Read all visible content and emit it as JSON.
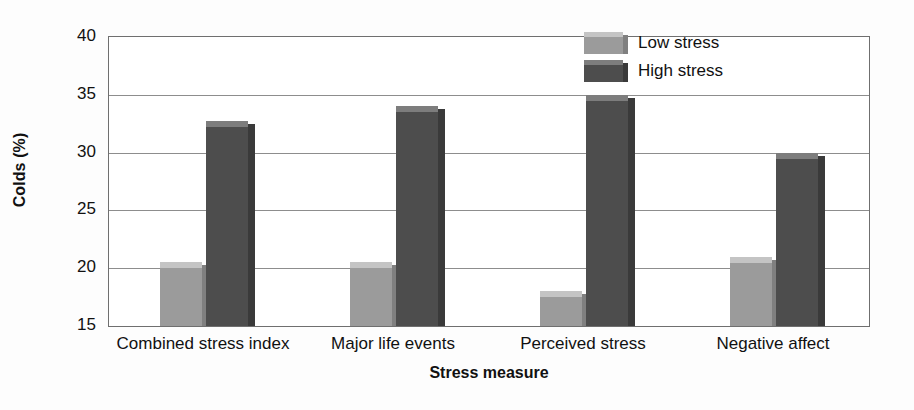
{
  "chart_data": {
    "type": "bar",
    "title": "",
    "xlabel": "Stress measure",
    "ylabel": "Colds (%)",
    "categories": [
      "Combined stress index",
      "Major life events",
      "Perceived stress",
      "Negative affect"
    ],
    "series": [
      {
        "name": "Low stress",
        "color": "#9b9b9b",
        "values": [
          20.5,
          20.5,
          18.0,
          21.0
        ]
      },
      {
        "name": "High stress",
        "color": "#4d4d4d",
        "values": [
          32.7,
          34.0,
          35.0,
          30.0
        ]
      }
    ],
    "ylim": [
      15,
      40
    ],
    "yticks": [
      15,
      20,
      25,
      30,
      35,
      40
    ],
    "ytick_labels": [
      "15",
      "20",
      "25",
      "30",
      "35",
      "40"
    ],
    "grid": true,
    "legend_position": "top-right"
  },
  "axes": {
    "y_title": "Colds (%)",
    "x_title": "Stress measure"
  },
  "legend": {
    "entries": [
      {
        "label": "Low stress"
      },
      {
        "label": "High stress"
      }
    ]
  }
}
